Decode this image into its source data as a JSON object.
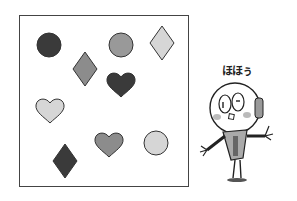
{
  "puzzle": {
    "shapes": [
      {
        "type": "circle",
        "shade": "dark",
        "color": "#3a3a3a",
        "cx": 49,
        "cy": 45,
        "r": 12
      },
      {
        "type": "circle",
        "shade": "medium",
        "color": "#999999",
        "cx": 121,
        "cy": 45,
        "r": 12
      },
      {
        "type": "diamond",
        "shade": "light",
        "color": "#d6d6d6",
        "cx": 162,
        "cy": 43
      },
      {
        "type": "diamond",
        "shade": "medium",
        "color": "#8c8c8c",
        "cx": 85,
        "cy": 69
      },
      {
        "type": "heart",
        "shade": "dark",
        "color": "#3a3a3a",
        "cx": 121,
        "cy": 84
      },
      {
        "type": "heart",
        "shade": "light",
        "color": "#d6d6d6",
        "cx": 50,
        "cy": 110
      },
      {
        "type": "heart",
        "shade": "medium",
        "color": "#8c8c8c",
        "cx": 109,
        "cy": 144
      },
      {
        "type": "circle",
        "shade": "light",
        "color": "#d6d6d6",
        "cx": 156,
        "cy": 143,
        "r": 12
      },
      {
        "type": "diamond",
        "shade": "dark",
        "color": "#3a3a3a",
        "cx": 65,
        "cy": 161
      }
    ]
  },
  "character": {
    "speech": "ほほぅ",
    "icon": "robot-character-icon"
  }
}
